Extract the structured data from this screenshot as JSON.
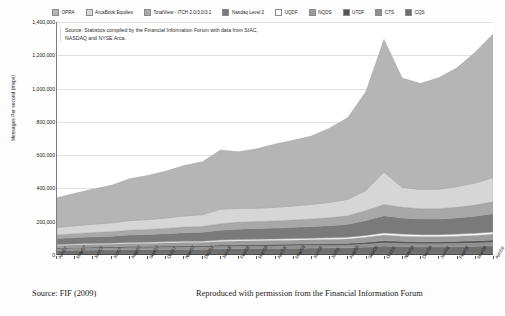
{
  "chart_data": {
    "type": "area",
    "stacked": true,
    "title": "",
    "xlabel": "",
    "ylabel": "Messages Per second (msps)",
    "ylim": [
      0,
      1400000
    ],
    "ytick_values": [
      0,
      200000,
      400000,
      600000,
      800000,
      1000000,
      1200000,
      1400000
    ],
    "ytick_labels": [
      "0",
      "200,000",
      "400,000",
      "600,000",
      "800,000",
      "1,000,000",
      "1,200,000",
      "1,400,000"
    ],
    "grid": true,
    "legend_position": "top",
    "categories": [
      "Apr/07",
      "May/07",
      "Jun/07",
      "Jul/07",
      "Aug/07",
      "Sep/07",
      "Oct/07",
      "Nov/07",
      "Dec/07",
      "Jan/08",
      "Feb/08",
      "Mar/08",
      "Apr/08",
      "May/08",
      "Jun/08",
      "Jul/08",
      "Aug/08",
      "Sep/08",
      "Oct/08",
      "Nov/08",
      "Dec/08",
      "Jan/09",
      "Feb/09",
      "Mar/09",
      "Apr/09"
    ],
    "series": [
      {
        "name": "CQS",
        "color": "#6e6e6e",
        "values": [
          21000,
          23000,
          24000,
          25000,
          27000,
          27000,
          28000,
          29000,
          29000,
          32000,
          33000,
          34000,
          34000,
          35000,
          36000,
          37000,
          38000,
          42000,
          48000,
          45000,
          44000,
          44000,
          45000,
          47000,
          50000
        ]
      },
      {
        "name": "CTS",
        "color": "#8f8f8f",
        "values": [
          9000,
          9500,
          10000,
          10000,
          11000,
          11000,
          11500,
          12000,
          12000,
          13000,
          13500,
          14000,
          14000,
          14500,
          15000,
          15000,
          15500,
          17000,
          19000,
          18000,
          17500,
          17500,
          18000,
          19000,
          20000
        ]
      },
      {
        "name": "UTDF",
        "color": "#555555",
        "values": [
          7000,
          7200,
          7500,
          7800,
          8000,
          8200,
          8500,
          8800,
          9000,
          9500,
          9800,
          10000,
          10200,
          10500,
          10800,
          11000,
          11500,
          12500,
          14000,
          13500,
          13000,
          13000,
          13500,
          14000,
          15000
        ]
      },
      {
        "name": "NQDS",
        "color": "#9c9c9c",
        "values": [
          14000,
          15000,
          15500,
          16000,
          17000,
          17500,
          18000,
          19000,
          19500,
          21000,
          22000,
          22500,
          23000,
          23500,
          24000,
          25000,
          26000,
          29000,
          33000,
          31000,
          30000,
          30000,
          31000,
          32000,
          34000
        ]
      },
      {
        "name": "UQDF",
        "color": "#fbfbfb",
        "values": [
          6000,
          6200,
          6500,
          6800,
          7000,
          7200,
          7500,
          7800,
          8000,
          8500,
          8800,
          9000,
          9200,
          9500,
          9800,
          10000,
          10500,
          11500,
          13000,
          12500,
          12000,
          12000,
          12500,
          13000,
          14000
        ]
      },
      {
        "name": "Nasdaq Level 2",
        "color": "#7a7a7a",
        "values": [
          36000,
          38000,
          40000,
          42000,
          45000,
          47000,
          49000,
          52000,
          54000,
          60000,
          63000,
          65000,
          66000,
          68000,
          70000,
          73000,
          78000,
          90000,
          104000,
          98000,
          95000,
          95000,
          98000,
          103000,
          110000
        ]
      },
      {
        "name": "TotalView - ITCH 2.0/3.0/3.1",
        "color": "#a8a8a8",
        "values": [
          22000,
          24000,
          26000,
          27000,
          29000,
          30000,
          32000,
          34000,
          35000,
          39000,
          41000,
          42000,
          43000,
          44000,
          46000,
          48000,
          51000,
          59000,
          68000,
          64000,
          62000,
          62000,
          64000,
          67000,
          72000
        ]
      },
      {
        "name": "ArcaBook Equities",
        "color": "#d6d6d6",
        "values": [
          45000,
          48000,
          50000,
          53000,
          58000,
          60000,
          63000,
          67000,
          70000,
          88000,
          84000,
          80000,
          82000,
          85000,
          88000,
          92000,
          100000,
          122000,
          196000,
          120000,
          116000,
          118000,
          124000,
          133000,
          146000
        ]
      },
      {
        "name": "OPRA",
        "color": "#b5b5b5",
        "values": [
          180000,
          196000,
          212000,
          228000,
          252000,
          266000,
          283000,
          304000,
          320000,
          356000,
          342000,
          358000,
          382000,
          396000,
          412000,
          448000,
          492000,
          596000,
          800000,
          660000,
          640000,
          672000,
          716000,
          788000,
          866000
        ]
      }
    ],
    "total_values": [
      340000,
      366900,
      391500,
      415600,
      454000,
      476900,
      504000,
      539600,
      566500,
      627000,
      617100,
      634500,
      663400,
      686000,
      711600,
      759000,
      823000,
      979000,
      1295000,
      1062000,
      1029500,
      1063500,
      1132000,
      1216000,
      1327000
    ],
    "annotation": {
      "text": "Source: Statistics compiled by the Financial Information Forum with data from SIAC, NASDAQ and NYSE Arca."
    }
  },
  "legend": {
    "items": [
      {
        "label": "OPRA",
        "color": "#b5b5b5"
      },
      {
        "label": "ArcaBook Equities",
        "color": "#d6d6d6"
      },
      {
        "label": "TotalView - ITCH 2.0/3.0/3.1",
        "color": "#a8a8a8"
      },
      {
        "label": "Nasdaq Level 2",
        "color": "#7a7a7a"
      },
      {
        "label": "UQDF",
        "color": "#fbfbfb"
      },
      {
        "label": "NQDS",
        "color": "#9c9c9c"
      },
      {
        "label": "UTDF",
        "color": "#555555"
      },
      {
        "label": "CTS",
        "color": "#8f8f8f"
      },
      {
        "label": "CQS",
        "color": "#6e6e6e"
      }
    ]
  },
  "caption": {
    "left": "Source: FIF (2009)",
    "right": "Reproduced with permission from the Financial Information Forum"
  }
}
